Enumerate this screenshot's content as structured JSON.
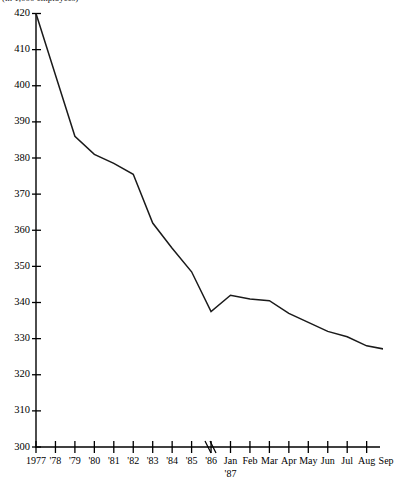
{
  "caption": "(in 1,000 employees)",
  "chart_data": {
    "type": "line",
    "title": "",
    "subtitle": "",
    "xlabel": "",
    "ylabel": "(in 1,000 employees)",
    "ylim": [
      300,
      420
    ],
    "ytick_step": 10,
    "yticks": [
      300,
      310,
      320,
      330,
      340,
      350,
      360,
      370,
      380,
      390,
      400,
      410,
      420
    ],
    "ytick_labels": [
      "300",
      "310",
      "320",
      "330",
      "340",
      "350",
      "360",
      "370",
      "380",
      "390",
      "400",
      "410",
      "420"
    ],
    "grid": false,
    "legend": false,
    "legend_position": "none",
    "axis_break": {
      "present": true,
      "symbol": "//",
      "between": [
        "'86",
        "Jan '87"
      ],
      "note": "scale changes from annual to monthly"
    },
    "categories": [
      "1977",
      "'78",
      "'79",
      "'80",
      "'81",
      "'82",
      "'83",
      "'84",
      "'85",
      "'86",
      "Jan",
      "Feb",
      "Mar",
      "Apr",
      "May",
      "Jun",
      "Jul",
      "Aug",
      "Sep"
    ],
    "category_sublabels": {
      "Jan": "'87"
    },
    "series": [
      {
        "name": "Employment",
        "values": [
          420,
          403,
          386,
          381,
          378.5,
          375.5,
          362,
          355,
          348.5,
          337.5,
          342,
          341,
          340.5,
          337,
          334.5,
          332,
          330.5,
          328,
          327
        ]
      }
    ]
  }
}
